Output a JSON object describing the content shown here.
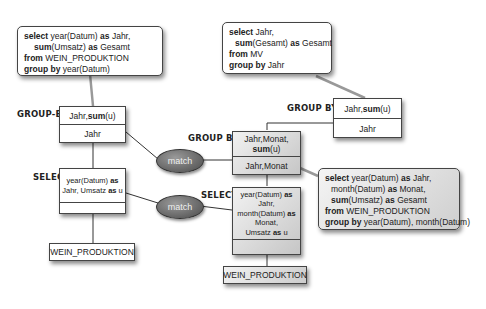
{
  "left_plan": {
    "sql_note": {
      "lines": [
        {
          "kw": "select",
          "text": " year(Datum) ",
          "kw2": "as",
          "text2": " Jahr,"
        },
        {
          "kw": "sum",
          "text": "(Umsatz) ",
          "kw2": "as",
          "text2": " Gesamt"
        },
        {
          "kw": "from",
          "text": " WEIN_PRODUKTION",
          "kw2": "",
          "text2": ""
        },
        {
          "kw": "group by",
          "text": " year(Datum)",
          "kw2": "",
          "text2": ""
        }
      ]
    },
    "groupby": {
      "label": "GROUP-BY",
      "top_pre": "Jahr,",
      "top_kw": "sum",
      "top_post": "(u)",
      "bottom": "Jahr"
    },
    "select": {
      "label": "SELECT",
      "line1_pre": "year(Datum) ",
      "line1_kw": "as",
      "line2_pre": "Jahr, Umsatz ",
      "line2_kw": "as",
      "line2_post": " u"
    },
    "table": {
      "name": "WEIN_PRODUKTION"
    }
  },
  "right_plan": {
    "sql_note": {
      "lines": [
        {
          "kw": "select",
          "text": " Jahr,",
          "kw2": "",
          "text2": ""
        },
        {
          "kw": "sum",
          "text": "(Gesamt) ",
          "kw2": "as",
          "text2": " Gesamt"
        },
        {
          "kw": "from",
          "text": " MV",
          "kw2": "",
          "text2": ""
        },
        {
          "kw": "group by",
          "text": " Jahr",
          "kw2": "",
          "text2": ""
        }
      ]
    },
    "groupby": {
      "label": "GROUP BY",
      "top_pre": "Jahr,",
      "top_kw": "sum",
      "top_post": "(u)",
      "bottom": "Jahr"
    }
  },
  "mv_plan": {
    "sql_note": {
      "lines": [
        {
          "kw": "select",
          "text": " year(Datum) ",
          "kw2": "as",
          "text2": " Jahr,"
        },
        {
          "kw": "",
          "text": "month(Datum) ",
          "kw2": "as",
          "text2": " Monat,"
        },
        {
          "kw": "sum",
          "text": "(Umsatz) ",
          "kw2": "as",
          "text2": " Gesamt"
        },
        {
          "kw": "from",
          "text": " WEIN_PRODUKTION",
          "kw2": "",
          "text2": ""
        },
        {
          "kw": "group by",
          "text": " year(Datum), month(Datum)",
          "kw2": "",
          "text2": ""
        }
      ]
    },
    "groupby": {
      "label": "GROUP BY",
      "top_line1": "Jahr,Monat,",
      "top_kw": "sum",
      "top_post": "(u)",
      "bottom": "Jahr,Monat"
    },
    "select": {
      "label": "SELECT",
      "l1_pre": "year(Datum) ",
      "l1_kw": "as",
      "l2": "Jahr,",
      "l3_pre": "month(Datum) ",
      "l3_kw": "as",
      "l4": "Monat,",
      "l5_pre": "Umsatz ",
      "l5_kw": "as",
      "l5_post": " u"
    },
    "table": {
      "name": "WEIN_PRODUKTION"
    }
  },
  "matches": [
    {
      "label": "match"
    },
    {
      "label": "match"
    }
  ]
}
